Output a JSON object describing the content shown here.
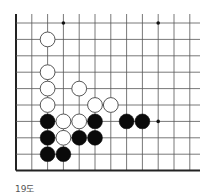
{
  "diagram": {
    "caption": "19도",
    "grid": {
      "origin_x": 16,
      "origin_y": 23,
      "dx": 15.8,
      "dy": 16.4,
      "cols": 12,
      "rows": 10,
      "right_extent": 200,
      "top_extent": 14,
      "line_color": "#555555",
      "edge_color": "#222222"
    },
    "star_points": [
      {
        "col": 3,
        "row": 0
      },
      {
        "col": 9,
        "row": 0
      },
      {
        "col": 9,
        "row": 6
      }
    ],
    "stones": [
      {
        "color": "white",
        "col": 2,
        "row": 1
      },
      {
        "color": "white",
        "col": 2,
        "row": 3
      },
      {
        "color": "white",
        "col": 2,
        "row": 4
      },
      {
        "color": "white",
        "col": 4,
        "row": 4
      },
      {
        "color": "white",
        "col": 2,
        "row": 5
      },
      {
        "color": "white",
        "col": 5,
        "row": 5
      },
      {
        "color": "white",
        "col": 6,
        "row": 5
      },
      {
        "color": "black",
        "col": 2,
        "row": 6
      },
      {
        "color": "white",
        "col": 3,
        "row": 6
      },
      {
        "color": "white",
        "col": 4,
        "row": 6
      },
      {
        "color": "black",
        "col": 5,
        "row": 6
      },
      {
        "color": "black",
        "col": 7,
        "row": 6
      },
      {
        "color": "black",
        "col": 8,
        "row": 6
      },
      {
        "color": "black",
        "col": 2,
        "row": 7
      },
      {
        "color": "white",
        "col": 3,
        "row": 7
      },
      {
        "color": "black",
        "col": 4,
        "row": 7
      },
      {
        "color": "black",
        "col": 5,
        "row": 7
      },
      {
        "color": "black",
        "col": 2,
        "row": 8
      },
      {
        "color": "black",
        "col": 3,
        "row": 8
      }
    ]
  }
}
